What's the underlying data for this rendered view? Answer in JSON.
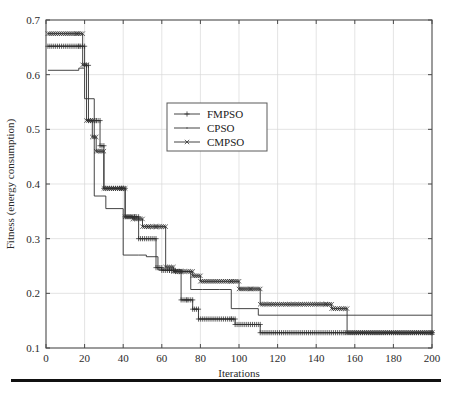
{
  "chart_data": {
    "type": "line",
    "title": "",
    "xlabel": "Iterations",
    "ylabel": "Fitness (energy consumption)",
    "xlim": [
      0,
      200
    ],
    "ylim": [
      0.1,
      0.7
    ],
    "xticks": [
      0,
      20,
      40,
      60,
      80,
      100,
      120,
      140,
      160,
      180,
      200
    ],
    "yticks": [
      0.1,
      0.2,
      0.3,
      0.4,
      0.5,
      0.6,
      0.7
    ],
    "xtick_labels": [
      "0",
      "20",
      "40",
      "60",
      "80",
      "100",
      "120",
      "140",
      "160",
      "180",
      "200"
    ],
    "ytick_labels": [
      "0.1",
      "0.2",
      "0.3",
      "0.4",
      "0.5",
      "0.6",
      "0.7"
    ],
    "grid": true,
    "legend_position": "upper center",
    "step_style": "post",
    "series": [
      {
        "name": "FMPSO",
        "marker": "plus",
        "color": "#2f2f2f",
        "x": [
          1,
          17,
          20,
          22,
          26,
          28,
          30,
          39,
          41,
          46,
          48,
          57,
          60,
          64,
          67,
          70,
          73,
          76,
          79,
          96,
          98,
          111,
          200
        ],
        "y": [
          0.652,
          0.652,
          0.617,
          0.516,
          0.516,
          0.47,
          0.392,
          0.392,
          0.34,
          0.34,
          0.3,
          0.247,
          0.242,
          0.242,
          0.24,
          0.188,
          0.188,
          0.171,
          0.153,
          0.153,
          0.143,
          0.128,
          0.128
        ]
      },
      {
        "name": "CPSO",
        "marker": "dot",
        "color": "#2f2f2f",
        "x": [
          1,
          15,
          17,
          20,
          22,
          25,
          29,
          31,
          40,
          48,
          52,
          58,
          64,
          70,
          75,
          81,
          90,
          96,
          110,
          200
        ],
        "y": [
          0.608,
          0.608,
          0.612,
          0.556,
          0.556,
          0.378,
          0.378,
          0.355,
          0.27,
          0.27,
          0.267,
          0.243,
          0.243,
          0.24,
          0.207,
          0.207,
          0.207,
          0.172,
          0.16,
          0.16
        ]
      },
      {
        "name": "CMPSO",
        "marker": "cross",
        "color": "#2f2f2f",
        "x": [
          1,
          16,
          19,
          21,
          24,
          26,
          30,
          39,
          41,
          45,
          50,
          53,
          57,
          62,
          66,
          70,
          76,
          80,
          96,
          100,
          106,
          111,
          145,
          148,
          156,
          200
        ],
        "y": [
          0.675,
          0.675,
          0.618,
          0.516,
          0.486,
          0.46,
          0.392,
          0.392,
          0.34,
          0.336,
          0.322,
          0.322,
          0.322,
          0.248,
          0.24,
          0.24,
          0.232,
          0.222,
          0.222,
          0.208,
          0.208,
          0.18,
          0.18,
          0.172,
          0.128,
          0.128
        ]
      }
    ]
  },
  "legend": {
    "entries": [
      {
        "label": "FMPSO",
        "marker": "plus"
      },
      {
        "label": "CPSO",
        "marker": "dot"
      },
      {
        "label": "CMPSO",
        "marker": "cross"
      }
    ]
  },
  "axes": {
    "x_title": "Iterations",
    "y_title": "Fitness (energy consumption)"
  }
}
